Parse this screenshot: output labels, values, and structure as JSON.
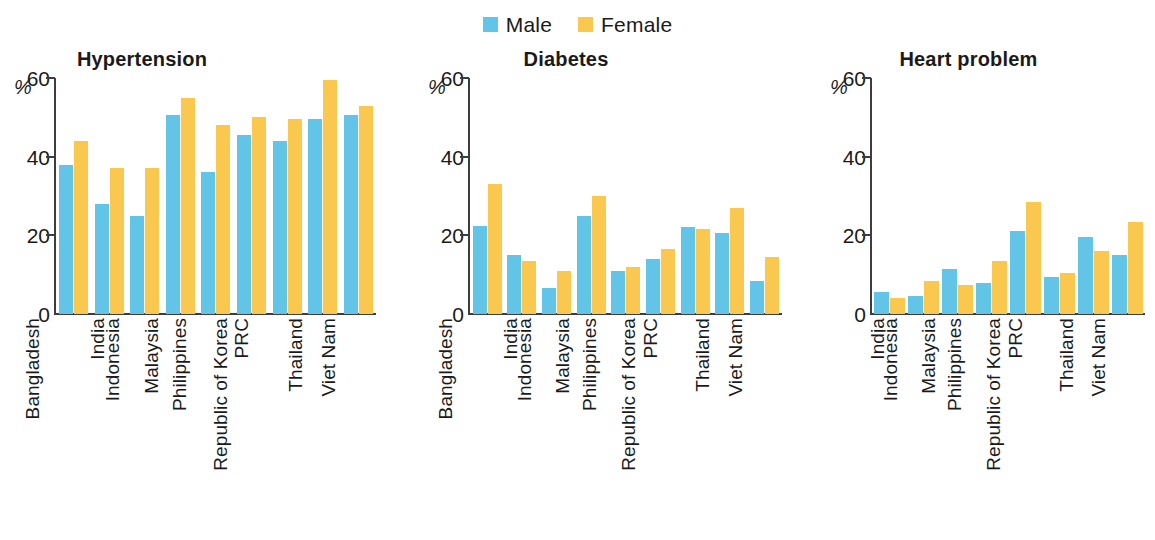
{
  "legend": {
    "entries": [
      {
        "label": "Male",
        "color": "#62c5e8",
        "swatch_name": "legend-swatch-male"
      },
      {
        "label": "Female",
        "color": "#fac84f",
        "swatch_name": "legend-swatch-female"
      }
    ]
  },
  "axis": {
    "unit_label": "%",
    "ticks": [
      "60",
      "40",
      "20",
      "0"
    ],
    "tick_values": [
      60,
      40,
      20,
      0
    ],
    "ymin": 0,
    "ymax": 60
  },
  "panels": [
    {
      "title": "Hypertension"
    },
    {
      "title": "Diabetes"
    },
    {
      "title": "Heart problem"
    }
  ],
  "chart_data": [
    {
      "type": "bar",
      "title": "Hypertension",
      "xlabel": "",
      "ylabel": "%",
      "ylim": [
        0,
        60
      ],
      "yticks": [
        0,
        20,
        40,
        60
      ],
      "grid": false,
      "legend_position": "top-center",
      "categories": [
        "Bangladesh",
        "India",
        "Indonesia",
        "Malaysia",
        "Philippines",
        "PRC",
        "Republic of Korea",
        "Thailand",
        "Viet Nam"
      ],
      "series": [
        {
          "name": "Male",
          "color": "#62c5e8",
          "values": [
            38,
            28,
            25,
            50.5,
            36,
            45.5,
            44,
            49.5,
            50.5
          ]
        },
        {
          "name": "Female",
          "color": "#fac84f",
          "values": [
            44,
            37,
            37,
            55,
            48,
            50,
            49.5,
            59.5,
            53
          ]
        }
      ]
    },
    {
      "type": "bar",
      "title": "Diabetes",
      "xlabel": "",
      "ylabel": "%",
      "ylim": [
        0,
        60
      ],
      "yticks": [
        0,
        20,
        40,
        60
      ],
      "grid": false,
      "legend_position": "top-center",
      "categories": [
        "Bangladesh",
        "India",
        "Indonesia",
        "Malaysia",
        "Philippines",
        "PRC",
        "Republic of Korea",
        "Thailand",
        "Viet Nam"
      ],
      "series": [
        {
          "name": "Male",
          "color": "#62c5e8",
          "values": [
            22.5,
            15,
            6.5,
            25,
            11,
            14,
            22,
            20.5,
            8.5
          ]
        },
        {
          "name": "Female",
          "color": "#fac84f",
          "values": [
            33,
            13.5,
            11,
            30,
            12,
            16.5,
            21.5,
            27,
            14.5
          ]
        }
      ]
    },
    {
      "type": "bar",
      "title": "Heart problem",
      "xlabel": "",
      "ylabel": "%",
      "ylim": [
        0,
        60
      ],
      "yticks": [
        0,
        20,
        40,
        60
      ],
      "grid": false,
      "legend_position": "top-center",
      "categories": [
        "India",
        "Indonesia",
        "Malaysia",
        "Philippines",
        "PRC",
        "Republic of Korea",
        "Thailand",
        "Viet Nam"
      ],
      "series": [
        {
          "name": "Male",
          "color": "#62c5e8",
          "values": [
            5.5,
            4.5,
            11.5,
            8,
            21,
            9.5,
            19.5,
            15
          ]
        },
        {
          "name": "Female",
          "color": "#fac84f",
          "values": [
            4,
            8.5,
            7.5,
            13.5,
            28.5,
            10.5,
            16,
            23.5
          ]
        }
      ]
    }
  ]
}
